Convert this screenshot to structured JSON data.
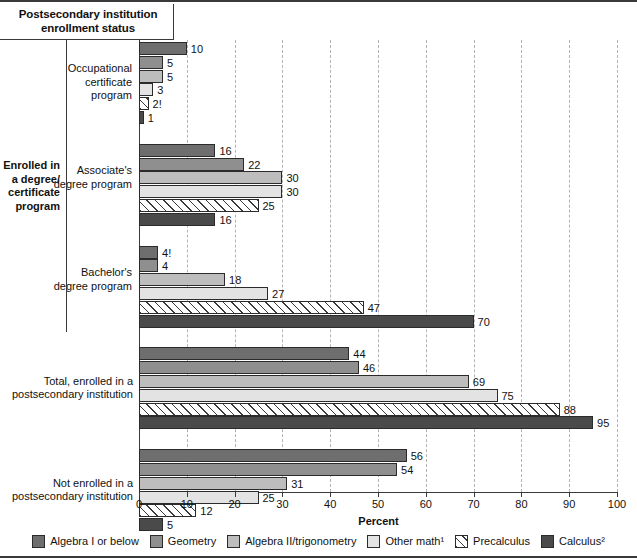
{
  "header": {
    "title": "Postsecondary institution enrollment status"
  },
  "axis": {
    "x_title": "Percent",
    "ticks": [
      0,
      10,
      20,
      30,
      40,
      50,
      60,
      70,
      80,
      90,
      100
    ]
  },
  "bracket": {
    "label": "Enrolled in a degree/ certificate program"
  },
  "legend": [
    {
      "name": "Algebra I or below",
      "swatch": "s0",
      "color": "#6e6e6e"
    },
    {
      "name": "Geometry",
      "swatch": "s1",
      "color": "#8f8f8f"
    },
    {
      "name": "Algebra II/trigonometry",
      "swatch": "s2",
      "color": "#bdbdbd"
    },
    {
      "name": "Other math¹",
      "swatch": "s3",
      "color": "#e3e3e3"
    },
    {
      "name": "Precalculus",
      "swatch": "s4",
      "color": "#ffffff"
    },
    {
      "name": "Calculus²",
      "swatch": "s5",
      "color": "#4a4a4a"
    }
  ],
  "chart_data": {
    "type": "bar",
    "orientation": "horizontal",
    "title": "Postsecondary institution enrollment status",
    "xlabel": "Percent",
    "ylabel": "",
    "xlim": [
      0,
      100
    ],
    "grid": "vertical-dashed-every-10",
    "legend_position": "bottom",
    "categories": [
      "Occupational certificate program",
      "Associate's degree program",
      "Bachelor's degree program",
      "Total, enrolled in a postsecondary institution",
      "Not enrolled in a postsecondary institution"
    ],
    "series": [
      {
        "name": "Algebra I or below",
        "values": [
          10,
          16,
          4,
          44,
          56
        ],
        "labels": [
          "10",
          "16",
          "4!",
          "44",
          "56"
        ]
      },
      {
        "name": "Geometry",
        "values": [
          5,
          22,
          4,
          46,
          54
        ],
        "labels": [
          "5",
          "22",
          "4",
          "46",
          "54"
        ]
      },
      {
        "name": "Algebra II/trigonometry",
        "values": [
          5,
          30,
          18,
          69,
          31
        ],
        "labels": [
          "5",
          "30",
          "18",
          "69",
          "31"
        ]
      },
      {
        "name": "Other math¹",
        "values": [
          3,
          30,
          27,
          75,
          25
        ],
        "labels": [
          "3",
          "30",
          "27",
          "75",
          "25"
        ]
      },
      {
        "name": "Precalculus",
        "values": [
          2,
          25,
          47,
          88,
          12
        ],
        "labels": [
          "2!",
          "25",
          "47",
          "88",
          "12"
        ]
      },
      {
        "name": "Calculus²",
        "values": [
          1,
          16,
          70,
          95,
          5
        ],
        "labels": [
          "1",
          "16",
          "70",
          "95",
          "5"
        ]
      }
    ]
  }
}
